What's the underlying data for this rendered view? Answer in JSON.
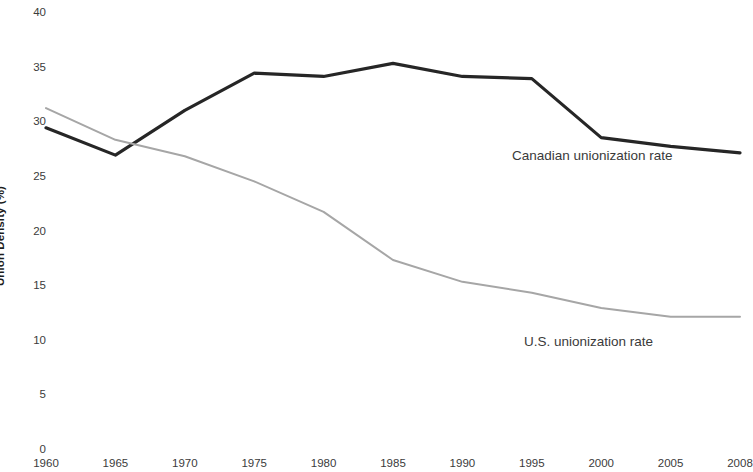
{
  "chart_data": {
    "type": "line",
    "title": "",
    "xlabel": "",
    "ylabel": "Union Density (%)",
    "x": [
      1960,
      1965,
      1970,
      1975,
      1980,
      1985,
      1990,
      1995,
      2000,
      2005,
      2008
    ],
    "x_tick_labels": [
      "1960",
      "1965",
      "1970",
      "1975",
      "1980",
      "1985",
      "1990",
      "1995",
      "2000",
      "2005",
      "2008"
    ],
    "y_tick_labels": [
      "40",
      "35",
      "30",
      "25",
      "20",
      "15",
      "10",
      "5",
      "0"
    ],
    "y_ticks": [
      40,
      35,
      30,
      25,
      20,
      15,
      10,
      5,
      0
    ],
    "ylim": [
      0,
      40
    ],
    "grid": false,
    "legend_position": "inline-annotation",
    "series": [
      {
        "name": "Canadian unionization rate",
        "color": "#262626",
        "values": [
          29.4,
          26.9,
          31.0,
          34.4,
          34.1,
          35.3,
          34.1,
          33.9,
          28.5,
          27.7,
          27.1
        ]
      },
      {
        "name": "U.S. unionization rate",
        "color": "#a6a6a6",
        "values": [
          31.2,
          28.3,
          26.8,
          24.5,
          21.7,
          17.3,
          15.3,
          14.3,
          12.9,
          12.1,
          12.1
        ]
      }
    ],
    "annotations": [
      {
        "text": "Canadian unionization rate",
        "series": "Canadian unionization rate"
      },
      {
        "text": "U.S. unionization rate",
        "series": "U.S. unionization rate"
      }
    ]
  }
}
